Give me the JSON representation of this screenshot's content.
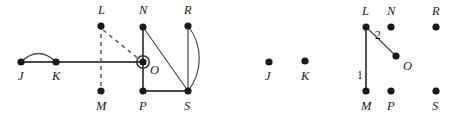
{
  "figure": {
    "width": 458,
    "height": 124,
    "background_color": "#ffffff",
    "node_color": "#1a1a1a",
    "edge_color": "#4a4a4a",
    "highlight_ring_color": "#3a3a3a"
  },
  "panels": [
    {
      "id": "left-panel",
      "name": "original-graph",
      "nodes": [
        {
          "id": "J",
          "label": "J",
          "x": 21,
          "y": 62,
          "label_x": 18,
          "label_y": 80,
          "highlighted": false
        },
        {
          "id": "K",
          "label": "K",
          "x": 56,
          "y": 62,
          "label_x": 52,
          "label_y": 80,
          "highlighted": false
        },
        {
          "id": "L",
          "label": "L",
          "x": 101,
          "y": 26,
          "label_x": 98,
          "label_y": 14,
          "highlighted": false
        },
        {
          "id": "M",
          "label": "M",
          "x": 101,
          "y": 91,
          "label_x": 96,
          "label_y": 110,
          "highlighted": false
        },
        {
          "id": "N",
          "label": "N",
          "x": 143,
          "y": 27,
          "label_x": 139,
          "label_y": 14,
          "highlighted": false
        },
        {
          "id": "O",
          "label": "O",
          "x": 143,
          "y": 62,
          "label_x": 150,
          "label_y": 74,
          "highlighted": true
        },
        {
          "id": "P",
          "label": "P",
          "x": 143,
          "y": 91,
          "label_x": 139,
          "label_y": 110,
          "highlighted": false
        },
        {
          "id": "R",
          "label": "R",
          "x": 188,
          "y": 26,
          "label_x": 184,
          "label_y": 14,
          "highlighted": false
        },
        {
          "id": "S",
          "label": "S",
          "x": 188,
          "y": 91,
          "label_x": 184,
          "label_y": 110,
          "highlighted": false
        }
      ],
      "edges": [
        {
          "from": "J",
          "to": "K",
          "style": "straight",
          "weight": null
        },
        {
          "from": "J",
          "to": "K",
          "style": "curve-up",
          "weight": null
        },
        {
          "from": "K",
          "to": "O",
          "style": "straight",
          "weight": null
        },
        {
          "from": "L",
          "to": "M",
          "style": "dashed-vertical",
          "weight": null
        },
        {
          "from": "L",
          "to": "O",
          "style": "dashed-diagonal",
          "weight": null
        },
        {
          "from": "N",
          "to": "O",
          "style": "straight",
          "weight": null
        },
        {
          "from": "O",
          "to": "P",
          "style": "straight",
          "weight": null
        },
        {
          "from": "N",
          "to": "S",
          "style": "thin-diagonal",
          "weight": null
        },
        {
          "from": "P",
          "to": "S",
          "style": "straight",
          "weight": null
        },
        {
          "from": "R",
          "to": "S",
          "style": "thin-straight",
          "weight": null
        },
        {
          "from": "R",
          "to": "S",
          "style": "curve-right",
          "weight": null
        }
      ]
    },
    {
      "id": "right-panel",
      "name": "resulting-graph",
      "nodes": [
        {
          "id": "J",
          "label": "J",
          "x": 269,
          "y": 62,
          "label_x": 265,
          "label_y": 80,
          "highlighted": false
        },
        {
          "id": "K",
          "label": "K",
          "x": 305,
          "y": 61,
          "label_x": 301,
          "label_y": 80,
          "highlighted": false
        },
        {
          "id": "L",
          "label": "L",
          "x": 366,
          "y": 27,
          "label_x": 362,
          "label_y": 15,
          "highlighted": false
        },
        {
          "id": "M",
          "label": "M",
          "x": 366,
          "y": 91,
          "label_x": 361,
          "label_y": 110,
          "highlighted": false
        },
        {
          "id": "N",
          "label": "N",
          "x": 391,
          "y": 27,
          "label_x": 387,
          "label_y": 15,
          "highlighted": false
        },
        {
          "id": "O",
          "label": "O",
          "x": 396,
          "y": 56,
          "label_x": 403,
          "label_y": 70,
          "highlighted": false
        },
        {
          "id": "P",
          "label": "P",
          "x": 391,
          "y": 91,
          "label_x": 387,
          "label_y": 110,
          "highlighted": false
        },
        {
          "id": "R",
          "label": "R",
          "x": 436,
          "y": 27,
          "label_x": 432,
          "label_y": 15,
          "highlighted": false
        },
        {
          "id": "S",
          "label": "S",
          "x": 436,
          "y": 91,
          "label_x": 432,
          "label_y": 110,
          "highlighted": false
        }
      ],
      "edges": [
        {
          "from": "L",
          "to": "M",
          "style": "straight",
          "weight": "1",
          "weight_x": 359,
          "weight_y": 78
        },
        {
          "from": "L",
          "to": "O",
          "style": "thin-diagonal",
          "weight": "2",
          "weight_x": 377,
          "weight_y": 38
        }
      ]
    }
  ],
  "weight_labels": [
    {
      "text": "1",
      "x": 359,
      "y": 78
    },
    {
      "text": "2",
      "x": 377,
      "y": 38
    }
  ]
}
